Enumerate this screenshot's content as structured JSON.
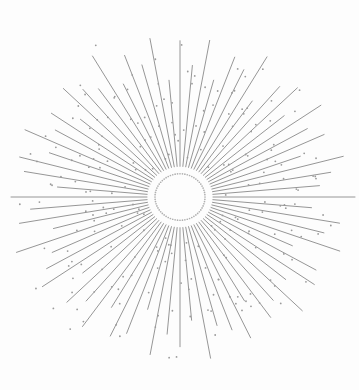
{
  "artwork": {
    "title": "Sunburst Starburst Ornament",
    "type": "vector-ornament",
    "canvas": {
      "width": 359,
      "height": 390,
      "background": "#fdfdfd"
    },
    "center": {
      "x": 180,
      "y": 197
    },
    "palette": {
      "ray_color": "#8a8a8a",
      "dot_color": "#9a9a9a",
      "ring_dot_color": "#b0b0b0",
      "background": "#fdfdfd"
    },
    "inner_ring": {
      "radius": 25,
      "dot_count": 64,
      "dot_radius": 0.85,
      "color": "#b0b0b0"
    },
    "rays": {
      "count": 72,
      "inner_radius": 33,
      "stroke_width": 0.9,
      "color": "#8a8a8a",
      "outer_radius_min": 118,
      "outer_radius_max": 176,
      "radial_scale_x": 1.0,
      "radial_scale_y": 0.93,
      "lengths": [
        168,
        142,
        171,
        130,
        160,
        151,
        174,
        126,
        155,
        166,
        136,
        172,
        147,
        159,
        128,
        169,
        153,
        140,
        175,
        132,
        162,
        149,
        170,
        124,
        157,
        164,
        138,
        173,
        145,
        158,
        129,
        167,
        152,
        143,
        176,
        133,
        161,
        148,
        172,
        125,
        156,
        165,
        137,
        170,
        146,
        160,
        127,
        168,
        154,
        141,
        174,
        131,
        163,
        150,
        169,
        123,
        158,
        166,
        139,
        171,
        144,
        157,
        130,
        165,
        151,
        142,
        175,
        134,
        162,
        147,
        173,
        126
      ]
    },
    "speckles": {
      "count_per_ray": 3,
      "dot_radius": 0.9,
      "color": "#9a9a9a",
      "radial_band": [
        40,
        185
      ],
      "angular_jitter_deg": 2.6
    }
  }
}
